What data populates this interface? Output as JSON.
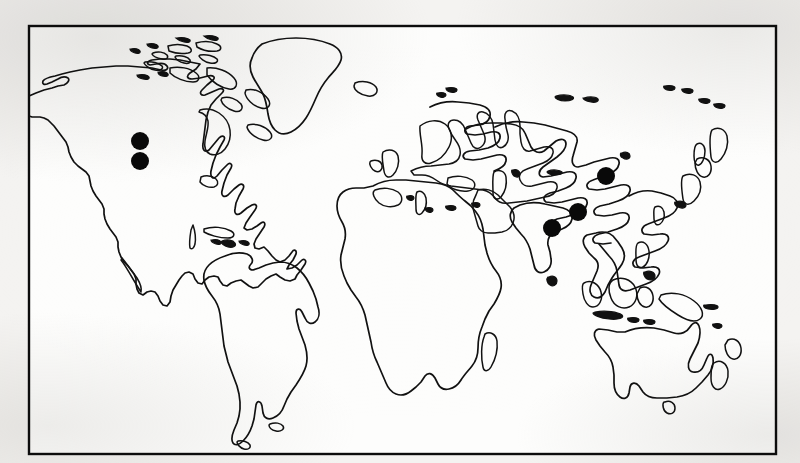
{
  "figure": {
    "kind": "world-distribution-map",
    "projection": "rectangular-world-outline",
    "caption": "",
    "title": "",
    "frame": {
      "stroke_color": "#0c0c0c",
      "fill_color": "#fdfdfc",
      "visible": true
    },
    "background_color": "#f4f3f1",
    "coastline_color": "#111111",
    "symbol_color": "#090909",
    "symbol_shape": "filled-circle",
    "legend": {
      "present": false,
      "entries": []
    },
    "axes": {
      "present": false,
      "graticule": false,
      "tick_labels": []
    }
  },
  "chart_data": {
    "type": "scatter",
    "title": "",
    "xlabel": "Longitude",
    "ylabel": "Latitude",
    "xlim": [
      -180,
      180
    ],
    "ylim": [
      -90,
      90
    ],
    "grid": false,
    "legend_position": "none",
    "series": [
      {
        "name": "Locality records",
        "marker": "filled-circle",
        "color": "#090909",
        "points": [
          {
            "id": 1,
            "label": "Western North America (north)",
            "region": "North America",
            "px": 140,
            "py": 141,
            "radius_px": 9,
            "lon": -114,
            "lat": 50
          },
          {
            "id": 2,
            "label": "Western North America (south)",
            "region": "North America",
            "px": 140,
            "py": 161,
            "radius_px": 9,
            "lon": -114,
            "lat": 42
          },
          {
            "id": 3,
            "label": "Northern China / Mongolia",
            "region": "Asia",
            "px": 606,
            "py": 176,
            "radius_px": 9,
            "lon": 104,
            "lat": 38
          },
          {
            "id": 4,
            "label": "Central China",
            "region": "Asia",
            "px": 578,
            "py": 212,
            "radius_px": 9,
            "lon": 91,
            "lat": 25
          },
          {
            "id": 5,
            "label": "Northern India / Himalaya",
            "region": "Asia",
            "px": 552,
            "py": 228,
            "radius_px": 9,
            "lon": 79,
            "lat": 19
          }
        ]
      }
    ],
    "counts": {
      "total_localities": 5,
      "north_america": 2,
      "asia": 3
    }
  },
  "landmasses": [
    {
      "name": "North America"
    },
    {
      "name": "Greenland"
    },
    {
      "name": "South America"
    },
    {
      "name": "Africa"
    },
    {
      "name": "Europe"
    },
    {
      "name": "Asia"
    },
    {
      "name": "Australia"
    },
    {
      "name": "New Zealand"
    },
    {
      "name": "Madagascar"
    },
    {
      "name": "Japan"
    },
    {
      "name": "Iceland"
    },
    {
      "name": "British Isles"
    },
    {
      "name": "Southeast Asian Archipelago"
    },
    {
      "name": "Canadian Arctic Archipelago"
    }
  ]
}
